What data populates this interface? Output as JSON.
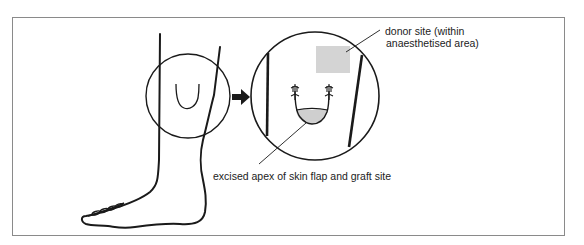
{
  "figure": {
    "type": "medical illustration"
  },
  "labels": {
    "donor_line1": "donor site (within",
    "donor_line2": "anaesthetised area)",
    "excised": "excised apex of skin flap and graft site"
  },
  "colors": {
    "stroke": "#1a1a1a",
    "frame": "#8a8a8a",
    "donor_fill": "#d4d4d4",
    "graft_fill": "#cfcfcf"
  },
  "elements": {
    "magnifier_arrow": "right-arrow",
    "small_circle": "region of interest on shin",
    "large_circle": "magnified view"
  }
}
